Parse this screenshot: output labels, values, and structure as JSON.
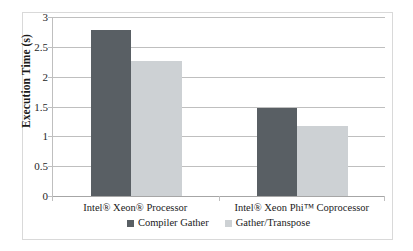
{
  "chart_data": {
    "type": "bar",
    "title": "",
    "xlabel": "",
    "ylabel": "Execution Time (s)",
    "ylim": [
      0,
      3
    ],
    "ytick_values": [
      3,
      2.5,
      2,
      1.5,
      1,
      0.5,
      0
    ],
    "ytick_labels": [
      "3",
      "2.5",
      "2",
      "1.5",
      "1",
      "0.5",
      "0"
    ],
    "grid": true,
    "legend_position": "bottom",
    "categories": [
      "Intel® Xeon® Processor",
      "Intel® Xeon Phi™ Coprocessor"
    ],
    "series": [
      {
        "name": "Compiler Gather",
        "color": "#595f64",
        "values": [
          2.78,
          1.48
        ]
      },
      {
        "name": "Gather/Transpose",
        "color": "#cdd1d4",
        "values": [
          2.26,
          1.18
        ]
      }
    ]
  },
  "legend": {
    "items": [
      {
        "label": "Compiler Gather",
        "swatch": "dark"
      },
      {
        "label": "Gather/Transpose",
        "swatch": "light"
      }
    ]
  },
  "colors": {
    "series_dark": "#595f64",
    "series_light": "#cdd1d4",
    "gridline": "#bfbfbf",
    "frame": "#d9d9d9",
    "text": "#1a1a1a",
    "background": "#ffffff"
  }
}
